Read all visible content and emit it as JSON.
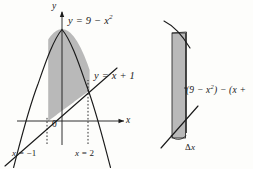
{
  "figure": {
    "background_color": "#fdfdfb",
    "ink_color": "#1a1a1a",
    "shade_color": "#8f8f8f"
  },
  "left_panel": {
    "axes": {
      "y_axis_label": "y",
      "x_axis_label": "x",
      "origin_label": "0"
    },
    "curves": [
      {
        "name": "parabola",
        "label_plain": "y = 9 - x^2",
        "label_lead": "y = 9 − x",
        "label_exp": "2"
      },
      {
        "name": "line",
        "label_plain": "y = x + 1",
        "label_text": "y = x + 1"
      }
    ],
    "boundaries": [
      {
        "name": "left-boundary",
        "label_lead": "x",
        "label_rest": " = −1"
      },
      {
        "name": "right-boundary",
        "label_lead": "x",
        "label_rest": " = 2"
      }
    ]
  },
  "right_panel": {
    "height_label": {
      "lead": "(9 − x",
      "exp": "2",
      "rest": ") − (x +"
    },
    "width_label": {
      "delta": "Δ",
      "var": "x"
    }
  },
  "chart_data": {
    "type": "line",
    "xlabel": "x",
    "ylabel": "y",
    "xlim": [
      -4.2,
      3.6
    ],
    "ylim": [
      -3.5,
      10.5
    ],
    "grid": false,
    "legend": "inline-labels",
    "series": [
      {
        "name": "y = 9 - x^2",
        "equation": "y = 9 - x^2",
        "type": "parabola",
        "x": [
          -3.6,
          -3.0,
          -2.5,
          -2.0,
          -1.5,
          -1.0,
          -0.5,
          0.0,
          0.5,
          1.0,
          1.5,
          2.0,
          2.5,
          3.0,
          3.4
        ],
        "y": [
          -3.96,
          0.0,
          2.75,
          5.0,
          6.75,
          8.0,
          8.75,
          9.0,
          8.75,
          8.0,
          6.75,
          5.0,
          2.75,
          0.0,
          -2.56
        ]
      },
      {
        "name": "y = x + 1",
        "equation": "y = x + 1",
        "type": "line",
        "slope": 1,
        "intercept": 1,
        "x": [
          -4.0,
          3.0
        ],
        "y": [
          -3.0,
          4.0
        ]
      }
    ],
    "shaded_region": {
      "between": [
        "y = 9 - x^2",
        "y = x + 1"
      ],
      "x_from": -1,
      "x_to": 2,
      "integrand": "(9 - x^2) - (x + 1)"
    },
    "vertical_markers": [
      {
        "x": -1,
        "label": "x = -1",
        "style": "dotted"
      },
      {
        "x": 2,
        "label": "x = 2",
        "style": "dotted"
      }
    ],
    "annotations": [
      {
        "text": "y = 9 - x^2",
        "x": 1.1,
        "y": 9.6
      },
      {
        "text": "y = x + 1",
        "x": 2.5,
        "y": 3.3
      },
      {
        "text": "0",
        "x": -0.35,
        "y": -0.6
      }
    ]
  }
}
